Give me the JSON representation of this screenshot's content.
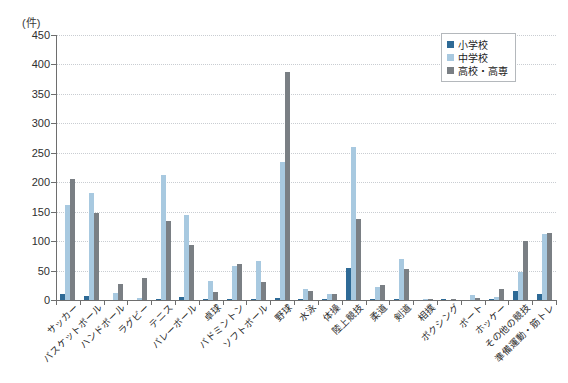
{
  "chart_data": {
    "type": "bar",
    "title": "",
    "subtitle": "",
    "xlabel": "",
    "ylabel": "(件)",
    "unit_label": "(件)",
    "ylim": [
      0,
      450
    ],
    "ytick_step": 50,
    "yticks": [
      0,
      50,
      100,
      150,
      200,
      250,
      300,
      350,
      400,
      450
    ],
    "ytick_labels": [
      "0",
      "50",
      "100",
      "150",
      "200",
      "250",
      "300",
      "350",
      "400",
      "450"
    ],
    "grid": true,
    "grid_axis": "y",
    "legend_position": "top-right",
    "categories": [
      "サッカー",
      "バスケットボール",
      "ハンドボール",
      "ラグビー",
      "テニス",
      "バレーボール",
      "卓球",
      "バドミントン",
      "ソフトボール",
      "野球",
      "水泳",
      "体操",
      "陸上競技",
      "柔道",
      "剣道",
      "相撲",
      "ボクシング",
      "ボート",
      "ホッケー",
      "その他の競技",
      "準備運動・筋トレ"
    ],
    "series": [
      {
        "name": "小学校",
        "color": "#2e6a96",
        "values": [
          10,
          6,
          0,
          0,
          2,
          5,
          1,
          1,
          2,
          3,
          2,
          1,
          55,
          2,
          1,
          0,
          1,
          0,
          1,
          15,
          10
        ]
      },
      {
        "name": "中学校",
        "color": "#a8c9e0",
        "values": [
          162,
          182,
          12,
          3,
          212,
          145,
          33,
          57,
          67,
          235,
          18,
          10,
          260,
          22,
          70,
          1,
          0,
          8,
          5,
          47,
          112
        ]
      },
      {
        "name": "高校・高専",
        "color": "#7a7f84",
        "values": [
          205,
          148,
          28,
          38,
          135,
          93,
          14,
          62,
          30,
          388,
          15,
          10,
          138,
          25,
          52,
          2,
          1,
          3,
          18,
          100,
          113
        ]
      }
    ]
  },
  "legend": {
    "items": [
      {
        "label": "小学校",
        "swatch": "#2e6a96"
      },
      {
        "label": "中学校",
        "swatch": "#a8c9e0"
      },
      {
        "label": "高校・高専",
        "swatch": "#7a7f84"
      }
    ]
  }
}
